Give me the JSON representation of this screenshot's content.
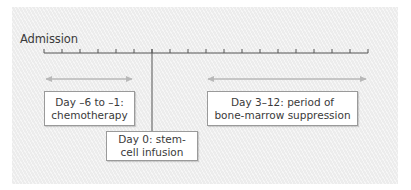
{
  "diagram": {
    "type": "timeline",
    "start_label": "Admission",
    "ticks": {
      "count": 19,
      "start_day": -6,
      "end_day": 12,
      "step_days": 1
    },
    "marker_day": 0,
    "spans": [
      {
        "id": "chemotherapy",
        "from_day": -6,
        "to_day": -1,
        "arrow": "double"
      },
      {
        "id": "bone-marrow-suppression",
        "from_day": 3,
        "to_day": 12,
        "arrow": "double"
      }
    ],
    "callouts": {
      "chemotherapy": {
        "lines": [
          "Day –6 to –1:",
          "chemotherapy"
        ]
      },
      "suppression": {
        "lines": [
          "Day 3–12: period of",
          "bone-marrow suppression"
        ]
      },
      "stem_cell": {
        "lines": [
          "Day 0: stem-",
          "cell infusion"
        ]
      }
    },
    "colors": {
      "background": "#ececec",
      "axis": "#555555",
      "arrow": "#b8b8b8",
      "box_border": "#9a9a9a",
      "text": "#3a3a3a"
    }
  }
}
